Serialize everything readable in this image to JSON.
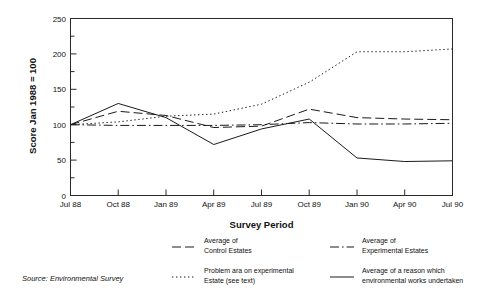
{
  "chart_data": {
    "type": "line",
    "title": "",
    "xlabel": "Survey Period",
    "ylabel": "Score Jan 1988 = 100",
    "categories": [
      "Jul 88",
      "Oct 88",
      "Jan 89",
      "Apr 89",
      "Jul 89",
      "Oct 89",
      "Jan 90",
      "Apr 90",
      "Jul 90"
    ],
    "ylim": [
      0,
      250
    ],
    "yticks": [
      0,
      50,
      100,
      150,
      200,
      250
    ],
    "yminorticks": [
      25,
      75,
      125,
      175,
      225
    ],
    "grid": false,
    "legend_position": "below",
    "series": [
      {
        "name": "Average of Control Estates",
        "style": "dashed",
        "values": [
          100,
          119,
          113,
          96,
          98,
          122,
          110,
          108,
          107
        ]
      },
      {
        "name": "Average of Experimental Estates",
        "style": "dash-dot",
        "values": [
          100,
          99,
          99,
          99,
          100,
          103,
          101,
          101,
          102
        ]
      },
      {
        "name": "Problem ara on experimental Estate (see text)",
        "style": "dotted",
        "values": [
          100,
          104,
          112,
          115,
          129,
          160,
          203,
          203,
          207
        ]
      },
      {
        "name": "Average of a reason which environmental works undertaken",
        "style": "solid",
        "values": [
          100,
          130,
          110,
          72,
          94,
          108,
          53,
          48,
          49
        ]
      }
    ]
  },
  "axes": {
    "ylabel": "Score Jan 1988 = 100",
    "xlabel": "Survey Period",
    "ytick_labels": [
      "0",
      "50",
      "100",
      "150",
      "200",
      "250"
    ],
    "xtick_labels": [
      "Jul 88",
      "Oct 88",
      "Jan 89",
      "Apr 89",
      "Jul 89",
      "Oct 89",
      "Jan 90",
      "Apr 90",
      "Jul 90"
    ]
  },
  "legend": {
    "entries": [
      {
        "style": "dashed",
        "line1": "Average of",
        "line2": "Control Estates"
      },
      {
        "style": "dash-dot",
        "line1": "Average of",
        "line2": "Experimental Estates"
      },
      {
        "style": "dotted",
        "line1": "Problem ara on experimental",
        "line2": "Estate (see text)"
      },
      {
        "style": "solid",
        "line1": "Average of a reason which",
        "line2": "environmental works undertaken"
      }
    ]
  },
  "source": {
    "text": "Source: Environmental Survey"
  },
  "colors": {
    "ink": "#1a1a1a",
    "background": "#ffffff"
  }
}
